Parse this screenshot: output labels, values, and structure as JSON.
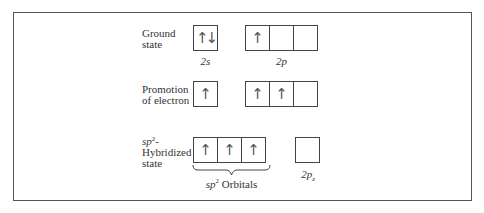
{
  "figure": {
    "rows": [
      {
        "id": "ground",
        "label_lines": [
          "Ground",
          "state"
        ],
        "groups": [
          {
            "name": "2s",
            "label": "2s",
            "cells": [
              "↑↓"
            ]
          },
          {
            "name": "2p",
            "label": "2p",
            "cells": [
              "↑",
              "",
              ""
            ]
          }
        ]
      },
      {
        "id": "promotion",
        "label_lines": [
          "Promotion",
          "of electron"
        ],
        "groups": [
          {
            "name": "2s",
            "cells": [
              "↑"
            ]
          },
          {
            "name": "2p",
            "cells": [
              "↑",
              "↑",
              ""
            ]
          }
        ]
      },
      {
        "id": "hybridized",
        "label_lines": [
          "sp",
          "2",
          "-",
          "Hybridized",
          "state"
        ],
        "groups": [
          {
            "name": "sp2",
            "label_main": "sp",
            "label_sup": "2",
            "label_suffix": " Orbitals",
            "cells": [
              "↑",
              "↑",
              "↑"
            ]
          },
          {
            "name": "2pz",
            "label_main": "2p",
            "label_sub": "z",
            "cells": [
              ""
            ]
          }
        ]
      }
    ]
  }
}
